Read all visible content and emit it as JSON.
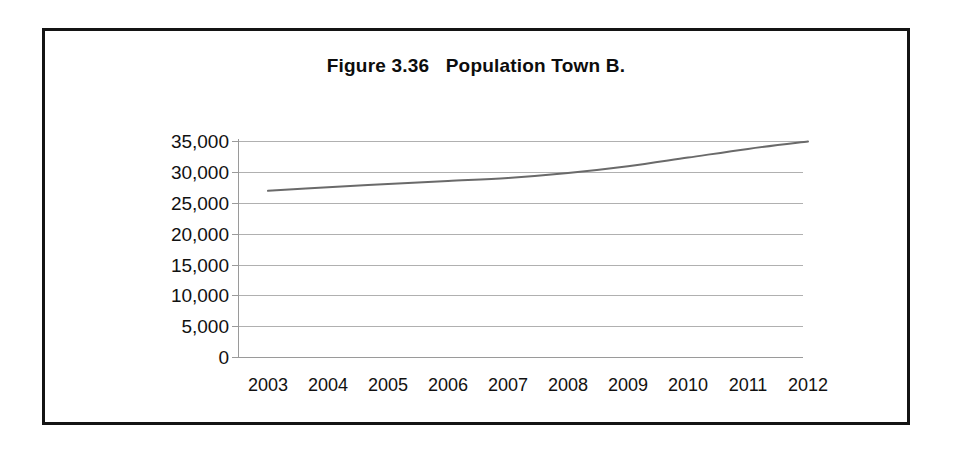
{
  "figure": {
    "title": "Figure 3.36   Population Town B.",
    "border_color": "#141414",
    "background_color": "#ffffff"
  },
  "chart_data": {
    "type": "line",
    "title": "Figure 3.36   Population Town B.",
    "xlabel": "",
    "ylabel": "",
    "categories": [
      "2003",
      "2004",
      "2005",
      "2006",
      "2007",
      "2008",
      "2009",
      "2010",
      "2011",
      "2012"
    ],
    "x": [
      2003,
      2004,
      2005,
      2006,
      2007,
      2008,
      2009,
      2010,
      2011,
      2012
    ],
    "values": [
      27000,
      27600,
      28100,
      28600,
      29100,
      29900,
      31000,
      32400,
      33800,
      35000
    ],
    "series": [
      {
        "name": "Population Town B",
        "values": [
          27000,
          27600,
          28100,
          28600,
          29100,
          29900,
          31000,
          32400,
          33800,
          35000
        ],
        "color": "#6a6a6a",
        "line_width": 2
      }
    ],
    "ylim": [
      0,
      35000
    ],
    "ytick_values": [
      35000,
      30000,
      25000,
      20000,
      15000,
      10000,
      5000,
      0
    ],
    "ytick_labels": [
      "35,000",
      "30,000",
      "25,000",
      "20,000",
      "15,000",
      "10,000",
      "5,000",
      "0"
    ],
    "xtick_labels": [
      "2003",
      "2004",
      "2005",
      "2006",
      "2007",
      "2008",
      "2009",
      "2010",
      "2011",
      "2012"
    ],
    "grid": "horizontal",
    "gridline_color": "#b0b0b0",
    "axis_color": "#9a9a9a",
    "legend": "none",
    "legend_position": "none",
    "markers": "none"
  }
}
